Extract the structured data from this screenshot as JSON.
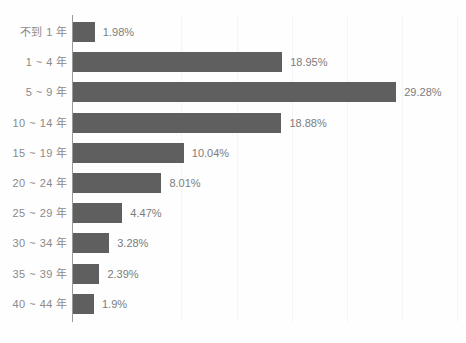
{
  "chart_data": {
    "type": "bar",
    "orientation": "horizontal",
    "title": "",
    "subtitle": "",
    "xlabel": "",
    "ylabel": "",
    "xlim": [
      0,
      35
    ],
    "grid": true,
    "legend": null,
    "legend_position": "none",
    "value_suffix": "%",
    "categories": [
      "不到 1 年",
      "1 ~ 4 年",
      "5 ~ 9 年",
      "10 ~ 14 年",
      "15 ~ 19 年",
      "20 ~ 24 年",
      "25 ~ 29 年",
      "30 ~ 34 年",
      "35 ~ 39 年",
      "40 ~ 44 年"
    ],
    "values": [
      1.98,
      18.95,
      29.28,
      18.88,
      10.04,
      8.01,
      4.47,
      3.28,
      2.39,
      1.9
    ],
    "value_labels": [
      "1.98%",
      "18.95%",
      "29.28%",
      "18.88%",
      "10.04%",
      "8.01%",
      "4.47%",
      "3.28%",
      "2.39%",
      "1.9%"
    ],
    "gridline_values": [
      10,
      15,
      20,
      25,
      30,
      35
    ],
    "colors": {
      "bar": "#5f5f5f",
      "axis": "#9a9a9a",
      "grid": "#f4f5f7",
      "category_text": "#8a8a8a",
      "value_text": "#7c7c7c",
      "background": "#fefefe"
    }
  }
}
